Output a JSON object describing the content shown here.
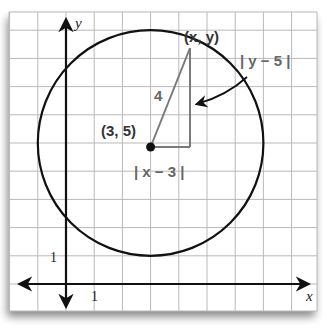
{
  "diagram": {
    "type": "coordinate-plane-circle",
    "axes": {
      "x_label": "x",
      "y_label": "y",
      "x_tick_label": "1",
      "y_tick_label": "1"
    },
    "circle": {
      "center": [
        3,
        5
      ],
      "radius": 4
    },
    "labels": {
      "center": "(3, 5)",
      "point": "(x, y)",
      "radius": "4",
      "horizontal_leg": "| x − 3 |",
      "vertical_leg": "| y − 5 |"
    },
    "colors": {
      "grid": "#b9b9b9",
      "axis": "#111111",
      "circle": "#111111",
      "triangle": "#7a7a7a",
      "label_gray": "#666666",
      "paper": "#ffffff"
    }
  }
}
